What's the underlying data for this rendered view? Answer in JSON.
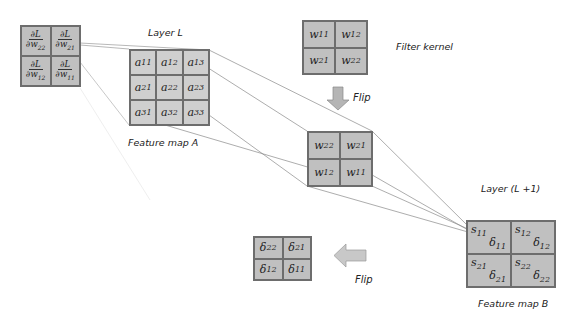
{
  "gradient_grid": {
    "cells": [
      {
        "num": "∂L",
        "den": "∂w",
        "sub": "22"
      },
      {
        "num": "∂L",
        "den": "∂w",
        "sub": "21"
      },
      {
        "num": "∂L",
        "den": "∂w",
        "sub": "12"
      },
      {
        "num": "∂L",
        "den": "∂w",
        "sub": "11"
      }
    ]
  },
  "layer_l": {
    "title": "Layer L",
    "caption": "Feature map A",
    "cells": [
      {
        "v": "a",
        "sub": "11"
      },
      {
        "v": "a",
        "sub": "12"
      },
      {
        "v": "a",
        "sub": "13"
      },
      {
        "v": "a",
        "sub": "21"
      },
      {
        "v": "a",
        "sub": "22"
      },
      {
        "v": "a",
        "sub": "23"
      },
      {
        "v": "a",
        "sub": "31"
      },
      {
        "v": "a",
        "sub": "32"
      },
      {
        "v": "a",
        "sub": "33"
      }
    ]
  },
  "filter_kernel": {
    "caption": "Filter kernel",
    "cells": [
      {
        "v": "w",
        "sub": "11"
      },
      {
        "v": "w",
        "sub": "12"
      },
      {
        "v": "w",
        "sub": "21"
      },
      {
        "v": "w",
        "sub": "22"
      }
    ]
  },
  "flip_down": {
    "label": "Flip"
  },
  "flipped_kernel": {
    "cells": [
      {
        "v": "w",
        "sub": "22"
      },
      {
        "v": "w",
        "sub": "21"
      },
      {
        "v": "w",
        "sub": "12"
      },
      {
        "v": "w",
        "sub": "11"
      }
    ]
  },
  "layer_l1": {
    "title": "Layer (L +1)",
    "caption": "Feature map B",
    "cells": [
      {
        "s": "s",
        "s_sub": "11",
        "d": "δ",
        "d_sub": "11"
      },
      {
        "s": "s",
        "s_sub": "12",
        "d": "δ",
        "d_sub": "12"
      },
      {
        "s": "s",
        "s_sub": "21",
        "d": "δ",
        "d_sub": "21"
      },
      {
        "s": "s",
        "s_sub": "22",
        "d": "δ",
        "d_sub": "22"
      }
    ]
  },
  "flip_left": {
    "label": "Flip"
  },
  "delta_flipped": {
    "cells": [
      {
        "v": "δ",
        "sub": "22"
      },
      {
        "v": "δ",
        "sub": "21"
      },
      {
        "v": "δ",
        "sub": "12"
      },
      {
        "v": "δ",
        "sub": "11"
      }
    ]
  },
  "colors": {
    "cell_fill": "#c0c0c0",
    "border": "#6d6d6d",
    "line": "#8a8a8a",
    "arrow_fill": "#b5b5b5"
  }
}
